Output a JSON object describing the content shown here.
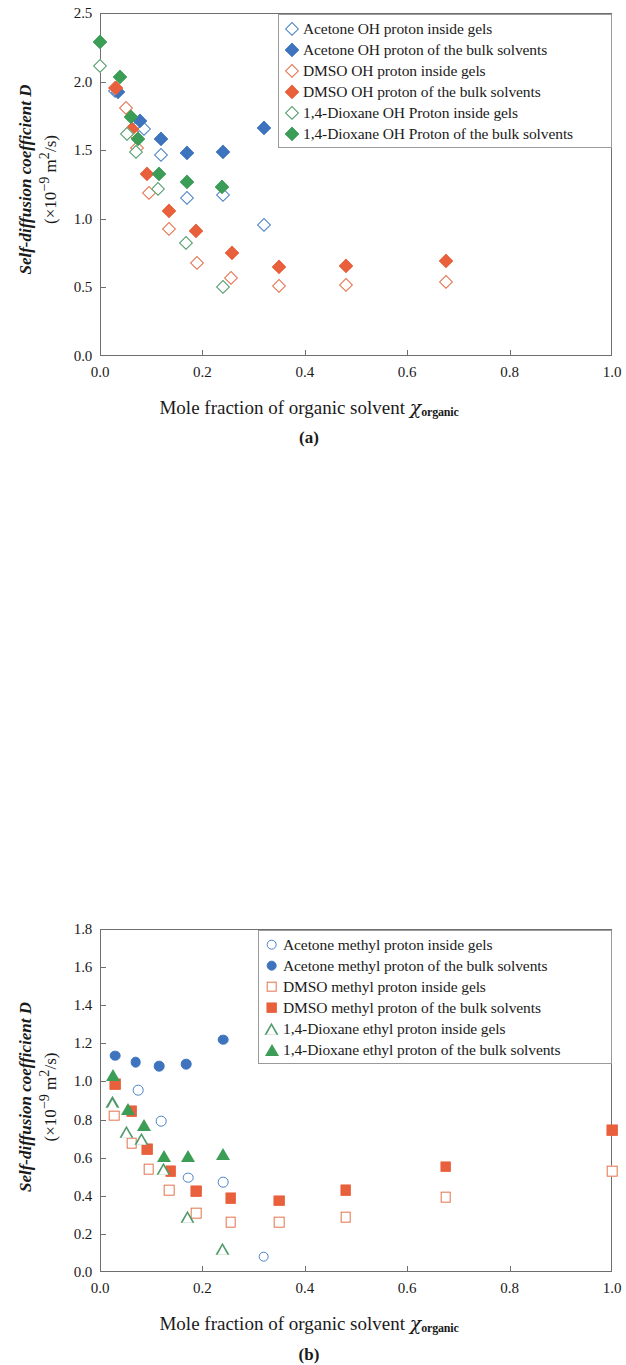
{
  "figure": {
    "ylabel_main": "Self-diffusion coefficient ",
    "ylabel_symbol": "D",
    "ylabel_units": "(×10",
    "ylabel_units_exp": "-9",
    "ylabel_units_tail": " m",
    "ylabel_units_exp2": "2",
    "ylabel_units_end": "/s)",
    "xlabel_main": "Mole fraction of organic solvent ",
    "xlabel_chi": "χ",
    "xlabel_sub": "organic"
  },
  "chart_data": [
    {
      "type": "scatter",
      "panel": "a",
      "panel_label": "(a)",
      "title": "",
      "xlabel": "Mole fraction of organic solvent χorganic",
      "ylabel": "Self-diffusion coefficient D (×10-9 m2/s)",
      "xlim": [
        0.0,
        1.0
      ],
      "ylim": [
        0.0,
        2.5
      ],
      "xticks": [
        "0.0",
        "0.2",
        "0.4",
        "0.6",
        "0.8",
        "1.0"
      ],
      "xtick_values": [
        0.0,
        0.2,
        0.4,
        0.6,
        0.8,
        1.0
      ],
      "yticks": [
        "0.0",
        "0.5",
        "1.0",
        "1.5",
        "2.0",
        "2.5"
      ],
      "ytick_values": [
        0.0,
        0.5,
        1.0,
        1.5,
        2.0,
        2.5
      ],
      "grid": false,
      "legend_position": "top-right",
      "series": [
        {
          "name": "Acetone OH proton inside gels",
          "marker": "diamond",
          "fill": "open",
          "color": "#4A82C4",
          "points": [
            [
              0.03,
              1.93
            ],
            [
              0.075,
              1.68
            ],
            [
              0.085,
              1.655
            ],
            [
              0.12,
              1.465
            ],
            [
              0.17,
              1.155
            ],
            [
              0.24,
              1.175
            ],
            [
              0.32,
              0.955
            ]
          ]
        },
        {
          "name": "Acetone OH proton of the bulk solvents",
          "marker": "diamond",
          "fill": "filled",
          "color": "#3E74BE",
          "points": [
            [
              0.035,
              1.925
            ],
            [
              0.078,
              1.715
            ],
            [
              0.12,
              1.585
            ],
            [
              0.17,
              1.48
            ],
            [
              0.24,
              1.49
            ],
            [
              0.32,
              1.665
            ]
          ]
        },
        {
          "name": "DMSO OH proton inside gels",
          "marker": "diamond",
          "fill": "open",
          "color": "#E4714A",
          "points": [
            [
              0.03,
              1.955
            ],
            [
              0.05,
              1.805
            ],
            [
              0.062,
              1.635
            ],
            [
              0.072,
              1.515
            ],
            [
              0.095,
              1.185
            ],
            [
              0.135,
              0.925
            ],
            [
              0.19,
              0.68
            ],
            [
              0.255,
              0.565
            ],
            [
              0.35,
              0.51
            ],
            [
              0.48,
              0.52
            ],
            [
              0.675,
              0.54
            ]
          ]
        },
        {
          "name": "DMSO OH proton  of the bulk solvents",
          "marker": "diamond",
          "fill": "filled",
          "color": "#E8603C",
          "points": [
            [
              0.032,
              1.95
            ],
            [
              0.062,
              1.655
            ],
            [
              0.092,
              1.33
            ],
            [
              0.135,
              1.06
            ],
            [
              0.188,
              0.91
            ],
            [
              0.258,
              0.75
            ],
            [
              0.35,
              0.65
            ],
            [
              0.48,
              0.655
            ],
            [
              0.675,
              0.69
            ]
          ]
        },
        {
          "name": "1,4-Dioxane OH Proton inside gels",
          "marker": "diamond",
          "fill": "open",
          "color": "#4E9A68",
          "points": [
            [
              0.0,
              2.115
            ],
            [
              0.052,
              1.615
            ],
            [
              0.07,
              1.485
            ],
            [
              0.113,
              1.215
            ],
            [
              0.168,
              0.825
            ],
            [
              0.24,
              0.505
            ]
          ]
        },
        {
          "name": "1,4-Dioxane OH Proton  of the bulk solvents",
          "marker": "diamond",
          "fill": "filled",
          "color": "#3C9D56",
          "points": [
            [
              0.0,
              2.285
            ],
            [
              0.04,
              2.035
            ],
            [
              0.06,
              1.745
            ],
            [
              0.075,
              1.58
            ],
            [
              0.115,
              1.33
            ],
            [
              0.17,
              1.265
            ],
            [
              0.238,
              1.23
            ]
          ]
        }
      ],
      "legend": [
        {
          "label": "Acetone OH proton inside gels",
          "marker": "diamond",
          "fill": "open",
          "color": "#4A82C4"
        },
        {
          "label": "Acetone OH proton of the bulk solvents",
          "marker": "diamond",
          "fill": "filled",
          "color": "#3E74BE"
        },
        {
          "label": "DMSO OH proton inside gels",
          "marker": "diamond",
          "fill": "open",
          "color": "#E4714A"
        },
        {
          "label": "DMSO OH proton  of the bulk solvents",
          "marker": "diamond",
          "fill": "filled",
          "color": "#E8603C"
        },
        {
          "label": "1,4-Dioxane OH Proton inside gels",
          "marker": "diamond",
          "fill": "open",
          "color": "#4E9A68"
        },
        {
          "label": "1,4-Dioxane OH Proton  of the bulk solvents",
          "marker": "diamond",
          "fill": "filled",
          "color": "#3C9D56"
        }
      ]
    },
    {
      "type": "scatter",
      "panel": "b",
      "panel_label": "(b)",
      "title": "",
      "xlabel": "Mole fraction of organic solvent χorganic",
      "ylabel": "Self-diffusion coefficient D (×10-9 m2/s)",
      "xlim": [
        0.0,
        1.0
      ],
      "ylim": [
        0.0,
        1.8
      ],
      "xticks": [
        "0.0",
        "0.2",
        "0.4",
        "0.6",
        "0.8",
        "1.0"
      ],
      "xtick_values": [
        0.0,
        0.2,
        0.4,
        0.6,
        0.8,
        1.0
      ],
      "yticks": [
        "0.0",
        "0.2",
        "0.4",
        "0.6",
        "0.8",
        "1.0",
        "1.2",
        "1.4",
        "1.6",
        "1.8"
      ],
      "ytick_values": [
        0.0,
        0.2,
        0.4,
        0.6,
        0.8,
        1.0,
        1.2,
        1.4,
        1.6,
        1.8
      ],
      "grid": false,
      "legend_position": "top-right",
      "series": [
        {
          "name": "Acetone methyl proton inside gels",
          "marker": "circle",
          "fill": "open",
          "color": "#4A82C4",
          "points": [
            [
              0.075,
              0.955
            ],
            [
              0.12,
              0.79
            ],
            [
              0.172,
              0.495
            ],
            [
              0.24,
              0.47
            ],
            [
              0.32,
              0.08
            ]
          ]
        },
        {
          "name": "Acetone methyl proton of the bulk solvents",
          "marker": "circle",
          "fill": "filled",
          "color": "#3E74BE",
          "points": [
            [
              0.03,
              1.135
            ],
            [
              0.07,
              1.1
            ],
            [
              0.115,
              1.08
            ],
            [
              0.168,
              1.09
            ],
            [
              0.24,
              1.22
            ],
            [
              0.32,
              1.55
            ]
          ]
        },
        {
          "name": "DMSO methyl proton inside gels",
          "marker": "square",
          "fill": "open",
          "color": "#E4714A",
          "points": [
            [
              0.028,
              0.82
            ],
            [
              0.062,
              0.675
            ],
            [
              0.095,
              0.54
            ],
            [
              0.135,
              0.43
            ],
            [
              0.188,
              0.31
            ],
            [
              0.255,
              0.26
            ],
            [
              0.35,
              0.26
            ],
            [
              0.48,
              0.288
            ],
            [
              0.675,
              0.392
            ],
            [
              1.0,
              0.53
            ]
          ]
        },
        {
          "name": "DMSO methyl proton of the bulk solvents",
          "marker": "square",
          "fill": "filled",
          "color": "#E8603C",
          "points": [
            [
              0.03,
              0.985
            ],
            [
              0.062,
              0.845
            ],
            [
              0.092,
              0.645
            ],
            [
              0.138,
              0.53
            ],
            [
              0.188,
              0.425
            ],
            [
              0.255,
              0.388
            ],
            [
              0.35,
              0.375
            ],
            [
              0.48,
              0.428
            ],
            [
              0.675,
              0.552
            ],
            [
              1.0,
              0.745
            ]
          ]
        },
        {
          "name": "1,4-Dioxane ethyl proton inside gels",
          "marker": "triangle",
          "fill": "open",
          "color": "#4E9A68",
          "points": [
            [
              0.025,
              0.89
            ],
            [
              0.052,
              0.735
            ],
            [
              0.082,
              0.7
            ],
            [
              0.125,
              0.54
            ],
            [
              0.172,
              0.29
            ],
            [
              0.24,
              0.12
            ]
          ]
        },
        {
          "name": "1,4-Dioxane ethyl proton of the bulk solvents",
          "marker": "triangle",
          "fill": "filled",
          "color": "#3C9D56",
          "points": [
            [
              0.025,
              1.035
            ],
            [
              0.055,
              0.855
            ],
            [
              0.085,
              0.77
            ],
            [
              0.125,
              0.61
            ],
            [
              0.172,
              0.61
            ],
            [
              0.24,
              0.62
            ]
          ]
        }
      ],
      "legend": [
        {
          "label": "Acetone methyl proton inside gels",
          "marker": "circle",
          "fill": "open",
          "color": "#4A82C4"
        },
        {
          "label": "Acetone methyl proton of the bulk solvents",
          "marker": "circle",
          "fill": "filled",
          "color": "#3E74BE"
        },
        {
          "label": "DMSO methyl proton inside gels",
          "marker": "square",
          "fill": "open",
          "color": "#E4714A"
        },
        {
          "label": "DMSO methyl proton of the bulk solvents",
          "marker": "square",
          "fill": "filled",
          "color": "#E8603C"
        },
        {
          "label": "1,4-Dioxane ethyl proton inside gels",
          "marker": "triangle",
          "fill": "open",
          "color": "#4E9A68"
        },
        {
          "label": "1,4-Dioxane ethyl proton of the bulk solvents",
          "marker": "triangle",
          "fill": "filled",
          "color": "#3C9D56"
        }
      ]
    }
  ]
}
